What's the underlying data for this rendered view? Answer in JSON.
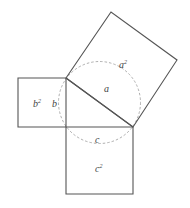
{
  "diagram": {
    "colors": {
      "line": "#555555",
      "dashed": "#9a9a9a",
      "text": "#444444",
      "background": "#ffffff"
    },
    "triangle": {
      "vertices": [
        [
          66,
          78
        ],
        [
          133,
          127
        ],
        [
          66,
          127
        ]
      ]
    },
    "squares": [
      {
        "id": "a2",
        "base": "a",
        "label": "a",
        "exponent": "2",
        "points": [
          [
            66,
            78
          ],
          [
            111,
            12
          ],
          [
            177,
            60
          ],
          [
            133,
            127
          ]
        ]
      },
      {
        "id": "b2",
        "base": "b",
        "label": "b",
        "exponent": "2",
        "points": [
          [
            18,
            78
          ],
          [
            66,
            78
          ],
          [
            66,
            127
          ],
          [
            18,
            127
          ]
        ]
      },
      {
        "id": "c2",
        "base": "c",
        "label": "c",
        "exponent": "2",
        "points": [
          [
            66,
            127
          ],
          [
            133,
            127
          ],
          [
            133,
            194
          ],
          [
            66,
            194
          ]
        ]
      }
    ],
    "circle": {
      "cx": 99.5,
      "cy": 102.5,
      "r": 41,
      "style": "dashed"
    },
    "side_labels": {
      "a": "a",
      "b": "b",
      "c": "c"
    },
    "area_labels": {
      "a2": {
        "base": "a",
        "exp": "2"
      },
      "b2": {
        "base": "b",
        "exp": "2"
      },
      "c2": {
        "base": "c",
        "exp": "2"
      }
    }
  }
}
